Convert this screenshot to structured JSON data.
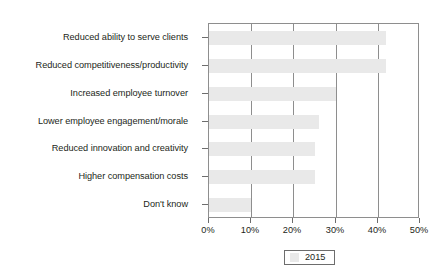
{
  "chart_data": {
    "type": "bar",
    "orientation": "horizontal",
    "title": "",
    "subtitle": "",
    "xlabel": "",
    "ylabel": "",
    "xlim": [
      0,
      50
    ],
    "grid": true,
    "legend_position": "bottom",
    "categories": [
      "Reduced ability to serve clients",
      "Reduced competitiveness/productivity",
      "Increased employee turnover",
      "Lower employee engagement/morale",
      "Reduced innovation and creativity",
      "Higher compensation costs",
      "Don't know"
    ],
    "xticks": [
      0,
      10,
      20,
      30,
      40,
      50
    ],
    "xtick_labels": [
      "0%",
      "10%",
      "20%",
      "30%",
      "40%",
      "50%"
    ],
    "series": [
      {
        "name": "2015",
        "color": "#e9e9e9",
        "values": [
          42,
          42,
          30,
          26,
          25,
          25,
          10
        ]
      }
    ],
    "legend": [
      {
        "label": "2015",
        "color": "#e9e9e9"
      }
    ]
  },
  "style": {
    "axis_color": "#8e8e8e",
    "tick_color": "#6d6d6d",
    "text_color": "#231f20",
    "plot_background": "#ffffff",
    "page_background": "#ffffff"
  }
}
